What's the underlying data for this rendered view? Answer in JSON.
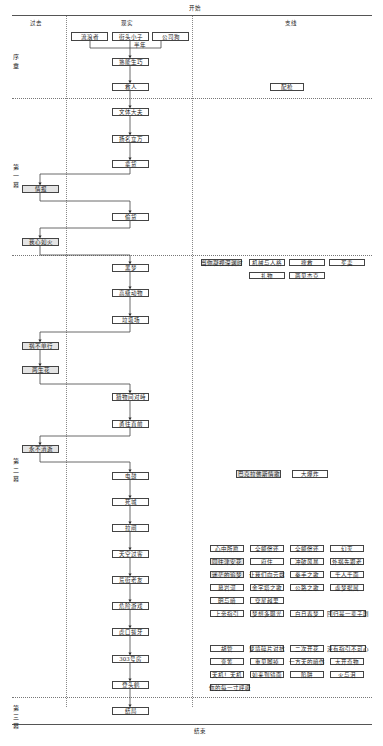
{
  "header": {
    "start": "开始",
    "end": "结束"
  },
  "columns": {
    "past": "过去",
    "present": "现实",
    "side": "支线"
  },
  "chapters": [
    {
      "label": "序\n章"
    },
    {
      "label": "第\n一\n幕"
    },
    {
      "label": "第\n二\n幕"
    },
    {
      "label": "第\n三\n幕"
    }
  ],
  "prologue": {
    "origins": [
      "流浪者",
      "街头小子",
      "公司狗"
    ],
    "half_year": "半年",
    "main": [
      "熟能生巧",
      "救人"
    ],
    "side": [
      "配枪"
    ]
  },
  "act1": {
    "main": [
      "文体大夫",
      "扬名立万",
      "拿货",
      "偷货"
    ],
    "past": [
      "情报",
      "我心如火"
    ]
  },
  "act2": {
    "main": [
      "黑梦",
      "高级动物",
      "垃圾场",
      "猎物间对峙",
      "勇往直前",
      "电鼓",
      "死城",
      "拉闸",
      "天空过客",
      "荒街老友",
      "危险游戏",
      "虎口拔牙",
      "303号房",
      "登头鹤"
    ],
    "past": [
      "祸不单行",
      "两生花",
      "永不消逝"
    ],
    "side_row1": [
      "当你凝视深渊时",
      "机械与人格",
      "搜救",
      "买卖",
      "礼物",
      "两见杰克"
    ],
    "side_row2": [
      "巴克拉佛斯情歌",
      "大爆炸"
    ],
    "side_grid1": [
      "心中所愿",
      "全额偿还",
      "全额偿还",
      "幻灭",
      "同往津安花",
      "府住",
      "冲破风暴",
      "外祸先跟老",
      "迷茫的追梦",
      "让我们向云端",
      "拳手之歌",
      "千人千面",
      "墓岩河",
      "金字塔之歌",
      "公路之歌",
      "虚梦据展",
      "明与暗",
      "穿星越里",
      "上帝指引",
      "梦想多曝光",
      "白日春梦",
      "回归是一辈子剧"
    ],
    "side_grid2": [
      "胡管",
      "梦境碎片对抗",
      "二次开花",
      "没有指引不可心",
      "变筹",
      "重见脚掉",
      "一方天的暗伤",
      "大开奇物",
      "天机！天机",
      "如来到镜面",
      "陷阱",
      "火与泪",
      "你的每一寸呼吸"
    ]
  },
  "act3": {
    "main": [
      "结局"
    ]
  }
}
